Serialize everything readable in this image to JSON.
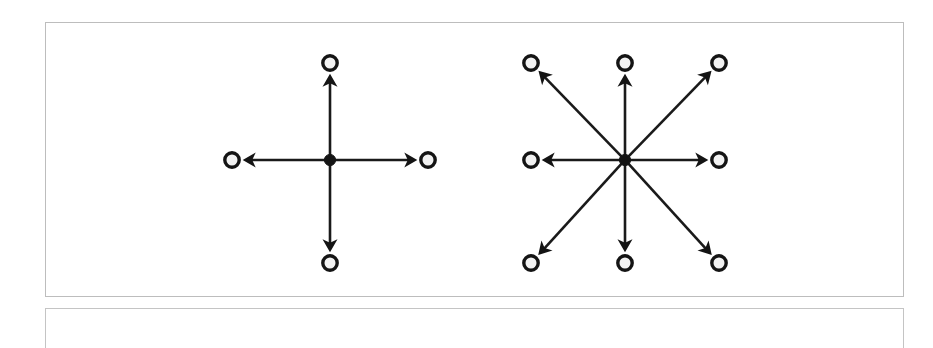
{
  "page": {
    "background_color": "#ffffff",
    "ink_color": "#1a1a1a",
    "frame_color": "#bdbdbd",
    "node_fill_color": "#f2f2f2",
    "center_fill_color": "#141414"
  },
  "figure": {
    "name": "pixel-connectivity-neighborhoods",
    "panel_count": 2
  },
  "diagrams": [
    {
      "id": "four-connected-neighborhood",
      "label": "4-connected neighborhood",
      "connectivity": 4,
      "center": {
        "x": 285,
        "y": 138
      },
      "radius_orthogonal": 103,
      "neighbor_count": 4,
      "neighbors": [
        {
          "direction": "north",
          "dx": 0,
          "dy": -1,
          "x": 285,
          "y": 41
        },
        {
          "direction": "east",
          "dx": 1,
          "dy": 0,
          "x": 383,
          "y": 138
        },
        {
          "direction": "south",
          "dx": 0,
          "dy": 1,
          "x": 285,
          "y": 241
        },
        {
          "direction": "west",
          "dx": -1,
          "dy": 0,
          "x": 187,
          "y": 138
        }
      ]
    },
    {
      "id": "eight-connected-neighborhood",
      "label": "8-connected neighborhood",
      "connectivity": 8,
      "center": {
        "x": 580,
        "y": 138
      },
      "radius_orthogonal": 95,
      "neighbor_count": 8,
      "neighbors": [
        {
          "direction": "north",
          "dx": 0,
          "dy": -1,
          "x": 580,
          "y": 41
        },
        {
          "direction": "northeast",
          "dx": 1,
          "dy": -1,
          "x": 674,
          "y": 41
        },
        {
          "direction": "east",
          "dx": 1,
          "dy": 0,
          "x": 674,
          "y": 138
        },
        {
          "direction": "southeast",
          "dx": 1,
          "dy": 1,
          "x": 674,
          "y": 241
        },
        {
          "direction": "south",
          "dx": 0,
          "dy": 1,
          "x": 580,
          "y": 241
        },
        {
          "direction": "southwest",
          "dx": -1,
          "dy": 1,
          "x": 486,
          "y": 241
        },
        {
          "direction": "west",
          "dx": -1,
          "dy": 0,
          "x": 486,
          "y": 138
        },
        {
          "direction": "northwest",
          "dx": -1,
          "dy": -1,
          "x": 486,
          "y": 41
        }
      ]
    }
  ]
}
